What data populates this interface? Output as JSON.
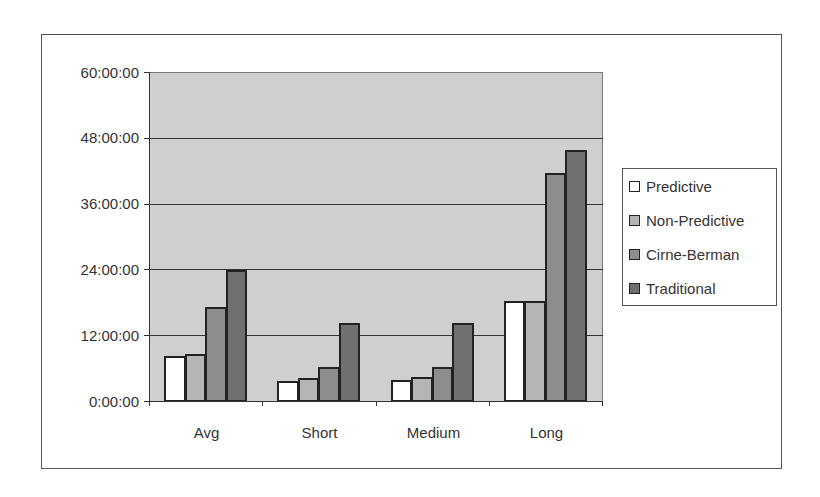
{
  "chart_data": {
    "type": "bar",
    "title": "",
    "xlabel": "",
    "ylabel": "",
    "categories": [
      "Avg",
      "Short",
      "Medium",
      "Long"
    ],
    "series": [
      {
        "name": "Predictive",
        "color": "#ffffff",
        "values_hours": [
          8.2,
          3.6,
          3.8,
          18.2
        ],
        "values": [
          "8:12:00",
          "3:36:00",
          "3:48:00",
          "18:12:00"
        ]
      },
      {
        "name": "Non-Predictive",
        "color": "#b5b5b5",
        "values_hours": [
          8.5,
          4.2,
          4.4,
          18.2
        ],
        "values": [
          "8:30:00",
          "4:12:00",
          "4:24:00",
          "18:12:00"
        ]
      },
      {
        "name": "Cirne-Berman",
        "color": "#8d8d8d",
        "values_hours": [
          17.1,
          6.2,
          6.2,
          41.6
        ],
        "values": [
          "17:06:00",
          "6:12:00",
          "6:12:00",
          "41:36:00"
        ]
      },
      {
        "name": "Traditional",
        "color": "#707070",
        "values_hours": [
          23.8,
          14.2,
          14.2,
          45.8
        ],
        "values": [
          "23:48:00",
          "14:12:00",
          "14:12:00",
          "45:48:00"
        ]
      }
    ],
    "yticks": [
      "0:00:00",
      "12:00:00",
      "24:00:00",
      "36:00:00",
      "48:00:00",
      "60:00:00"
    ],
    "ylim_hours": [
      0,
      60
    ],
    "grid": true,
    "legend_position": "right",
    "plot_background": "#cfcfcf"
  },
  "axis": {
    "y_labels": [
      "60:00:00",
      "48:00:00",
      "36:00:00",
      "24:00:00",
      "12:00:00",
      "0:00:00"
    ],
    "x_labels": [
      "Avg",
      "Short",
      "Medium",
      "Long"
    ]
  },
  "legend": {
    "items": [
      "Predictive",
      "Non-Predictive",
      "Cirne-Berman",
      "Traditional"
    ]
  }
}
